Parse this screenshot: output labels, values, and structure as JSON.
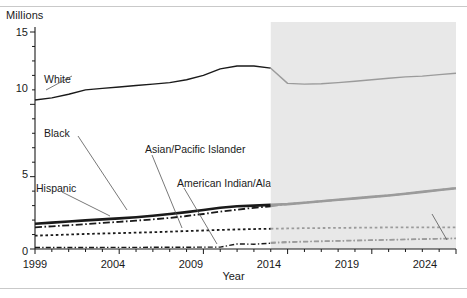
{
  "figure": {
    "yaxis_title": "Millions",
    "xaxis_title": "Year",
    "projected_label": "Projected"
  },
  "labels": {
    "white": "White",
    "black": "Black",
    "hispanic": "Hispanic",
    "asian": "Asian/Pacific Islander",
    "amind": "American Indian/Alaska Native",
    "tworaces": "Two or more races"
  },
  "ticks": {
    "y": [
      "0",
      "5",
      "10",
      "15"
    ],
    "x": [
      "1999",
      "2004",
      "2009",
      "2014",
      "2019",
      "2024"
    ]
  },
  "colors": {
    "line": "#1a1a1a",
    "projected_line": "#9b9b9b",
    "projected_band": "#e8e8e8",
    "axis": "#1a1a1a",
    "rule": "#c9c9c9"
  },
  "chart_data": {
    "type": "line",
    "title": "",
    "subtitle": "",
    "xlabel": "Year",
    "ylabel": "Millions",
    "xlim": [
      1999,
      2024
    ],
    "ylim": [
      0,
      15
    ],
    "yticks": [
      0,
      5,
      10,
      15
    ],
    "xticks": [
      1999,
      2004,
      2009,
      2014,
      2019,
      2024
    ],
    "grid": false,
    "legend": "inline-annotations",
    "minor_ticks": "every 1 year on x; every 1 million on y",
    "projection_start_year": 2013,
    "annotations": [
      {
        "text": "Projected",
        "x": 2019,
        "y": 14.2
      },
      {
        "text": "White",
        "x": 2000.6,
        "y": 11.2
      },
      {
        "text": "Black",
        "x": 2000.4,
        "y": 6.6
      },
      {
        "text": "Hispanic",
        "x": 1999.6,
        "y": 4.6
      },
      {
        "text": "Asian/Pacific Islander",
        "x": 2005.5,
        "y": 6.0
      },
      {
        "text": "American Indian/Alaska Native",
        "x": 2007.5,
        "y": 4.35
      },
      {
        "text": "Two or more races",
        "x": 2016.5,
        "y": 2.0
      }
    ],
    "x": [
      1999,
      2000,
      2001,
      2002,
      2003,
      2004,
      2005,
      2006,
      2007,
      2008,
      2009,
      2010,
      2011,
      2012,
      2013,
      2014,
      2015,
      2016,
      2017,
      2018,
      2019,
      2020,
      2021,
      2022,
      2023,
      2024
    ],
    "series": [
      {
        "name": "White",
        "style": "solid",
        "width": 1.4,
        "values": [
          10.3,
          10.45,
          10.7,
          11.0,
          11.1,
          11.2,
          11.3,
          11.4,
          11.5,
          11.7,
          12.0,
          12.45,
          12.65,
          12.65,
          12.5,
          11.45,
          11.4,
          11.42,
          11.5,
          11.6,
          11.7,
          11.8,
          11.9,
          11.95,
          12.05,
          12.15
        ]
      },
      {
        "name": "Hispanic",
        "style": "solid-thick",
        "width": 2.6,
        "values": [
          1.75,
          1.82,
          1.9,
          1.98,
          2.05,
          2.12,
          2.2,
          2.3,
          2.42,
          2.55,
          2.7,
          2.85,
          2.95,
          3.0,
          3.05,
          3.1,
          3.2,
          3.3,
          3.4,
          3.5,
          3.6,
          3.7,
          3.82,
          3.95,
          4.08,
          4.2
        ]
      },
      {
        "name": "Black",
        "style": "dash-dot",
        "width": 1.8,
        "values": [
          1.5,
          1.57,
          1.64,
          1.72,
          1.8,
          1.88,
          1.96,
          2.05,
          2.15,
          2.28,
          2.42,
          2.58,
          2.72,
          2.85,
          2.95,
          3.1,
          3.2,
          3.3,
          3.4,
          3.5,
          3.6,
          3.7,
          3.82,
          3.95,
          4.08,
          4.2
        ]
      },
      {
        "name": "Asian/Pacific Islander",
        "style": "dotted",
        "width": 1.8,
        "values": [
          0.92,
          0.96,
          1.0,
          1.04,
          1.07,
          1.1,
          1.13,
          1.16,
          1.2,
          1.24,
          1.28,
          1.32,
          1.35,
          1.38,
          1.4,
          1.42,
          1.44,
          1.45,
          1.46,
          1.47,
          1.48,
          1.49,
          1.5,
          1.5,
          1.5,
          1.5
        ]
      },
      {
        "name": "American Indian/Alaska Native",
        "style": "dash-dot-thin",
        "width": 1.4,
        "values": [
          0.1,
          0.1,
          0.1,
          0.1,
          0.11,
          0.11,
          0.11,
          0.12,
          0.12,
          0.12,
          0.13,
          0.13,
          0.35,
          0.33,
          0.4,
          0.45,
          0.5,
          0.52,
          0.55,
          0.57,
          0.6,
          0.62,
          0.65,
          0.67,
          0.7,
          0.72
        ]
      },
      {
        "name": "Two or more races",
        "style": "dash-dot-thin-projected",
        "width": 1.4,
        "values": [
          null,
          null,
          null,
          null,
          null,
          null,
          null,
          null,
          null,
          null,
          null,
          null,
          null,
          null,
          0.45,
          0.5,
          0.52,
          0.55,
          0.57,
          0.6,
          0.62,
          0.65,
          0.67,
          0.7,
          0.72,
          0.75
        ]
      }
    ]
  }
}
